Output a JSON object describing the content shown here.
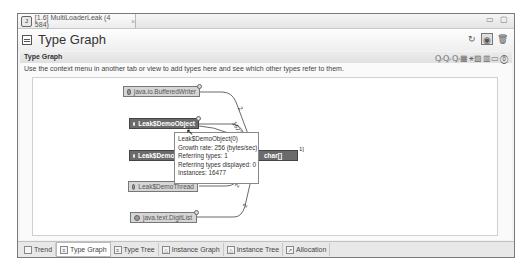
{
  "window": {
    "tab_title": "[1.6] MultiLoaderLeak (4 584)",
    "tab_close": "×",
    "controls": "▭ ▢"
  },
  "header": {
    "title": "Type Graph",
    "tools": [
      {
        "name": "refresh-icon",
        "glyph": "↻"
      },
      {
        "name": "view-toggle-icon",
        "glyph": "◉"
      },
      {
        "name": "trash-icon",
        "glyph": "🗑"
      }
    ]
  },
  "section": {
    "title": "Type Graph",
    "description": "Use the context menu in another tab or view to add types here and see which other types refer to them.",
    "tools": "ꝘꝘꝘ▦⚹▧▥▭⓪"
  },
  "graph": {
    "nodes": [
      {
        "label": "java.io.BufferedWriter",
        "style": "light"
      },
      {
        "label": "Leak$DemoObject",
        "style": "dark"
      },
      {
        "label": "Leak$DemoObject",
        "style": "dark"
      },
      {
        "label": "Leak$DemoThread",
        "style": "light"
      },
      {
        "label": "java.text.DigitList",
        "style": "light"
      },
      {
        "label": "char[]",
        "style": "dark"
      }
    ],
    "edge_labels": [
      "2",
      "1672",
      "2",
      "2"
    ],
    "char_badge": "1]"
  },
  "tooltip": {
    "name": "Leak$DemoObject(0)",
    "growth_rate": "Growth rate: 256 (bytes/sec)",
    "referring_types": "Referring types: 1",
    "referring_displayed": "Referring types displayed: 0",
    "instances": "Instances: 16477"
  },
  "bottom_tabs": [
    {
      "label": "Trend",
      "active": false
    },
    {
      "label": "Type Graph",
      "active": true
    },
    {
      "label": "Type Tree",
      "active": false
    },
    {
      "label": "Instance Graph",
      "active": false
    },
    {
      "label": "Instance Tree",
      "active": false
    },
    {
      "label": "Allocation",
      "active": false
    }
  ]
}
